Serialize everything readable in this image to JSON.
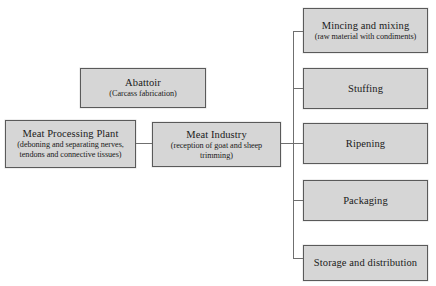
{
  "diagram": {
    "type": "flowchart",
    "colors": {
      "node_fill": "#d6d6d6",
      "node_border": "#5a5a5a",
      "connector": "#6f6f6f",
      "background": "#ffffff",
      "text": "#1a1a1a"
    },
    "nodes": {
      "meat_processing_plant": {
        "title": "Meat Processing Plant",
        "subtitle": "(deboning and separating nerves, tendons and connective tissues)"
      },
      "abattoir": {
        "title": "Abattoir",
        "subtitle": "(Carcass fabrication)"
      },
      "meat_industry": {
        "title": "Meat Industry",
        "subtitle": "(reception of goat and sheep trimming)"
      },
      "mincing_and_mixing": {
        "title": "Mincing and mixing",
        "subtitle": "(raw material with condiments)"
      },
      "stuffing": {
        "title": "Stuffing",
        "subtitle": ""
      },
      "ripening": {
        "title": "Ripening",
        "subtitle": ""
      },
      "packaging": {
        "title": "Packaging",
        "subtitle": ""
      },
      "storage_and_distribution": {
        "title": "Storage and distribution",
        "subtitle": ""
      }
    },
    "edges": [
      {
        "from": "meat_processing_plant",
        "to": "meat_industry",
        "style": "orthogonal"
      },
      {
        "from": "meat_industry",
        "to": "mincing_and_mixing",
        "style": "orthogonal"
      },
      {
        "from": "meat_industry",
        "to": "stuffing",
        "style": "orthogonal"
      },
      {
        "from": "meat_industry",
        "to": "ripening",
        "style": "orthogonal"
      },
      {
        "from": "meat_industry",
        "to": "packaging",
        "style": "orthogonal"
      },
      {
        "from": "meat_industry",
        "to": "storage_and_distribution",
        "style": "orthogonal"
      }
    ]
  }
}
